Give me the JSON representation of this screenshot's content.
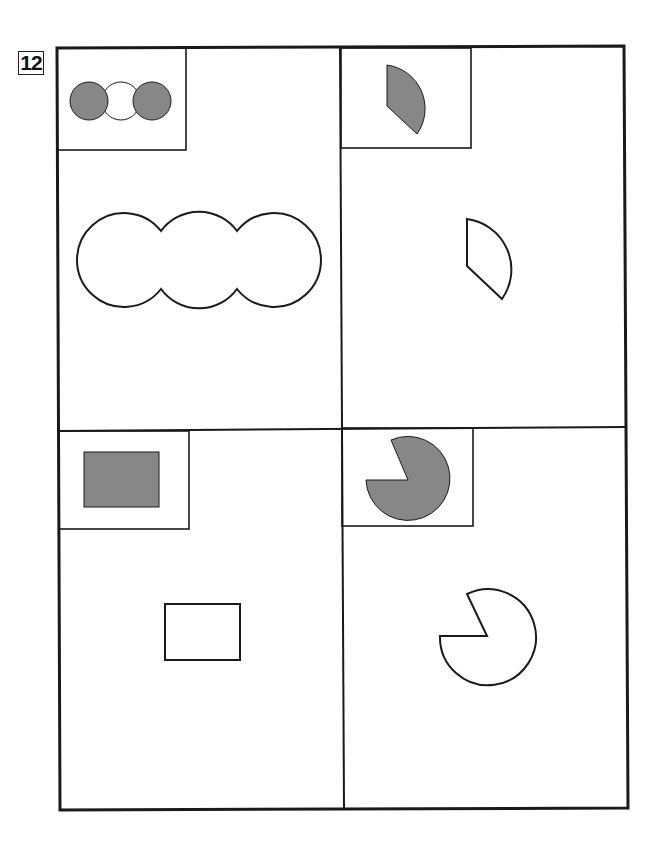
{
  "problem": {
    "number": "12"
  },
  "colors": {
    "line": "#1a1a1a",
    "shape_fill": "#878787",
    "background": "#ffffff"
  },
  "panels": [
    {
      "id": "top-left",
      "example_shape": "three-overlapping-circles-outer-two-shaded",
      "answer_shape": "three-overlapping-circles-outline"
    },
    {
      "id": "top-right",
      "example_shape": "quarter-circle-sector-shaded",
      "answer_shape": "quarter-circle-sector-outline"
    },
    {
      "id": "bottom-left",
      "example_shape": "rectangle-shaded",
      "answer_shape": "rectangle-outline"
    },
    {
      "id": "bottom-right",
      "example_shape": "pac-man-circle-shaded",
      "answer_shape": "pac-man-circle-outline"
    }
  ]
}
